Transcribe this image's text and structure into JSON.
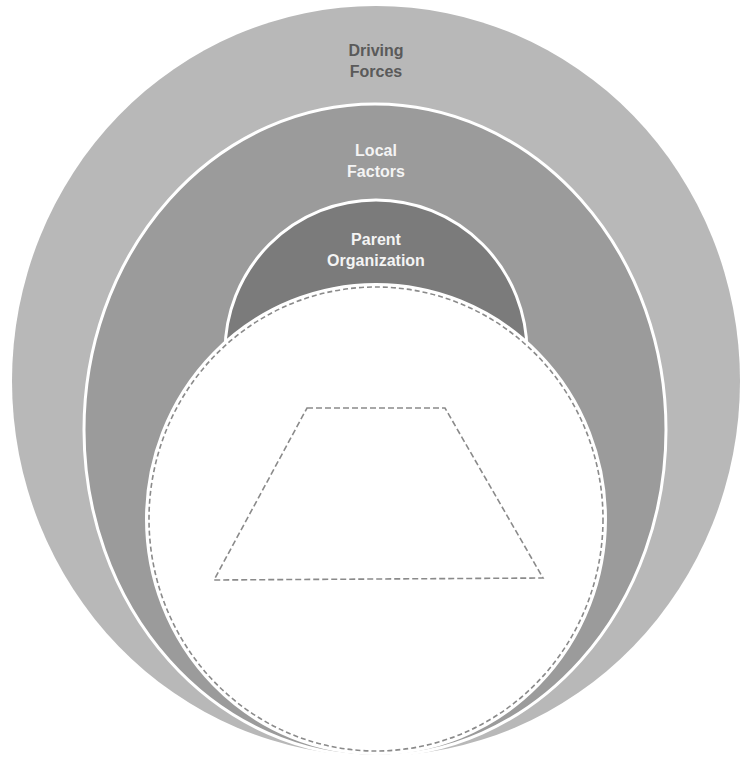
{
  "diagram": {
    "type": "nested-circles",
    "layers": [
      {
        "id": "driving-forces",
        "lines": [
          "Driving",
          "Forces"
        ],
        "fill": "#b8b8b8",
        "text_color": "#5a5a5a"
      },
      {
        "id": "local-factors",
        "lines": [
          "Local",
          "Factors"
        ],
        "fill": "#9b9b9b",
        "text_color": "#f4f4f4"
      },
      {
        "id": "parent-organization",
        "lines": [
          "Parent",
          "Organization"
        ],
        "fill": "#7b7b7b",
        "text_color": "#f4f4f4"
      }
    ],
    "inner_circle": {
      "fill": "#ffffff",
      "stroke": "#8a8a8a",
      "style": "dashed"
    },
    "inner_shape": {
      "type": "trapezoid",
      "stroke": "#8a8a8a",
      "style": "dashed"
    }
  }
}
